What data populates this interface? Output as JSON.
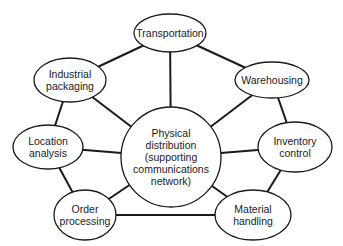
{
  "diagram": {
    "type": "hub-and-spoke network",
    "center": {
      "id": "center",
      "label": "Physical\ndistribution\n(supporting\ncommunications\nnetwork)",
      "cx": 171,
      "cy": 157,
      "r": 50
    },
    "nodes": [
      {
        "id": "transportation",
        "label": "Transportation",
        "cx": 170,
        "cy": 33,
        "rx": 36,
        "ry": 19
      },
      {
        "id": "warehousing",
        "label": "Warehousing",
        "cx": 272,
        "cy": 80,
        "rx": 37,
        "ry": 18
      },
      {
        "id": "inventory",
        "label": "Inventory\ncontrol",
        "cx": 295,
        "cy": 147,
        "rx": 37,
        "ry": 25
      },
      {
        "id": "material",
        "label": "Material\nhandling",
        "cx": 253,
        "cy": 215,
        "rx": 38,
        "ry": 25
      },
      {
        "id": "order",
        "label": "Order\nprocessing",
        "cx": 85,
        "cy": 215,
        "rx": 31,
        "ry": 25
      },
      {
        "id": "location",
        "label": "Location\nanalysis",
        "cx": 48,
        "cy": 147,
        "rx": 35,
        "ry": 22
      },
      {
        "id": "packaging",
        "label": "Industrial\npackaging",
        "cx": 70,
        "cy": 80,
        "rx": 36,
        "ry": 22
      }
    ],
    "edges": [
      [
        "transportation",
        "warehousing"
      ],
      [
        "warehousing",
        "inventory"
      ],
      [
        "inventory",
        "material"
      ],
      [
        "material",
        "order"
      ],
      [
        "order",
        "location"
      ],
      [
        "location",
        "packaging"
      ],
      [
        "packaging",
        "transportation"
      ],
      [
        "center",
        "transportation"
      ],
      [
        "center",
        "warehousing"
      ],
      [
        "center",
        "inventory"
      ],
      [
        "center",
        "material"
      ],
      [
        "center",
        "order"
      ],
      [
        "center",
        "location"
      ],
      [
        "center",
        "packaging"
      ]
    ],
    "colors": {
      "stroke": "#1a1a1a",
      "fill": "#ffffff",
      "text": "#1a1a1a"
    }
  }
}
